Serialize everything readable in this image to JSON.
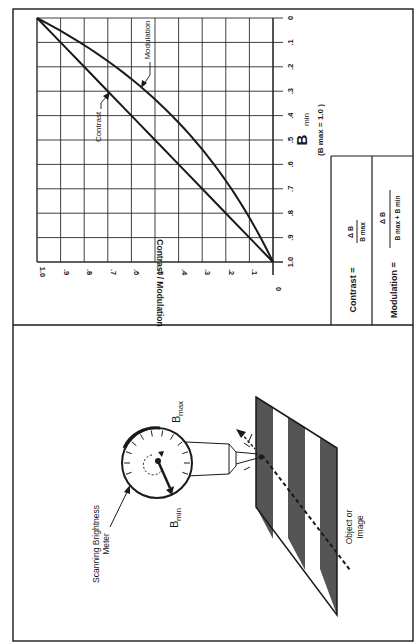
{
  "figure": {
    "orientation": "rotated-90-ccw",
    "chart_panel": {
      "y_axis_label": "Contrast / Modulation",
      "x_axis_label_main": "B",
      "x_axis_label_sub": "min",
      "x_axis_note": "(B max = 1.0 )",
      "x_ticks": [
        "0",
        ".1",
        ".2",
        ".3",
        ".4",
        ".5",
        ".6",
        ".7",
        ".8",
        ".9",
        "1.0"
      ],
      "y_ticks": [
        "0",
        ".1",
        ".2",
        ".3",
        ".4",
        ".5",
        ".6",
        ".7",
        ".8",
        ".9",
        "1.0"
      ],
      "curve_labels": {
        "contrast": "Contrast",
        "modulation": "Modulation"
      }
    },
    "formula_box": {
      "contrast_lhs": "Contrast =",
      "contrast_num": "Δ B",
      "contrast_den": "B max",
      "modulation_lhs": "Modulation =",
      "modulation_num": "Δ B",
      "modulation_den": "B max +  B min"
    },
    "illustration_panel": {
      "meter_label_line1": "Scanning Brightness",
      "meter_label_line2": "Meter",
      "bmax_label": "B",
      "bmax_sub": "max",
      "bmin_label": "B",
      "bmin_sub": "min",
      "object_label_line1": "Object or",
      "object_label_line2": "Image"
    },
    "colors": {
      "line": "#1a1a1a",
      "grid": "#2a2a2a",
      "stripe_dark": "#555555",
      "background": "#ffffff"
    }
  },
  "chart_data": {
    "type": "line",
    "title": "",
    "xlabel": "B min (B max = 1.0)",
    "ylabel": "Contrast / Modulation",
    "xlim": [
      0,
      1.0
    ],
    "ylim": [
      0,
      1.0
    ],
    "grid": true,
    "x": [
      0,
      0.1,
      0.2,
      0.3,
      0.4,
      0.5,
      0.6,
      0.7,
      0.8,
      0.9,
      1.0
    ],
    "series": [
      {
        "name": "Contrast",
        "formula": "ΔB / B max",
        "values": [
          1.0,
          0.9,
          0.8,
          0.7,
          0.6,
          0.5,
          0.4,
          0.3,
          0.2,
          0.1,
          0.0
        ]
      },
      {
        "name": "Modulation",
        "formula": "ΔB / (B max + B min)",
        "values": [
          1.0,
          0.82,
          0.67,
          0.54,
          0.43,
          0.33,
          0.25,
          0.18,
          0.11,
          0.05,
          0.0
        ]
      }
    ],
    "annotations": [
      "Contrast",
      "Modulation",
      "(B max = 1.0 )"
    ]
  }
}
